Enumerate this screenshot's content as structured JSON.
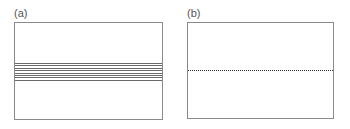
{
  "panels": [
    {
      "label": "(a)",
      "description": "box with a band of 8 horizontal solid lines"
    },
    {
      "label": "(b)",
      "description": "box with a single horizontal dotted line"
    }
  ],
  "panel_a": {
    "line_count": 8,
    "line_color": "#6a6a6a"
  },
  "panel_b": {
    "line_style": "dotted",
    "line_color": "#333333"
  },
  "colors": {
    "border": "#8a8a8a",
    "background": "#ffffff",
    "label": "#555555"
  }
}
